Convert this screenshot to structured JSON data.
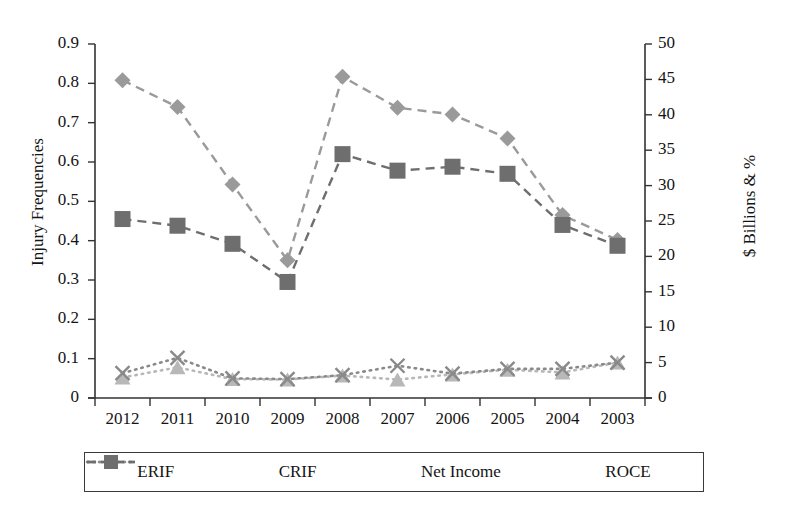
{
  "chart_data": {
    "type": "line",
    "title": "",
    "xlabel": "",
    "ylabel": "Injury Frequencies",
    "ylabel_right": "$ Billions & %",
    "categories": [
      "2012",
      "2011",
      "2010",
      "2009",
      "2008",
      "2007",
      "2006",
      "2005",
      "2004",
      "2003"
    ],
    "ylim": [
      0,
      0.9
    ],
    "ylim_right": [
      0,
      50
    ],
    "yticks": [
      "0",
      "0.1",
      "0.2",
      "0.3",
      "0.4",
      "0.5",
      "0.6",
      "0.7",
      "0.8",
      "0.9"
    ],
    "yticks_right": [
      "0",
      "5",
      "10",
      "15",
      "20",
      "25",
      "30",
      "35",
      "40",
      "45",
      "50"
    ],
    "grid": false,
    "legend_position": "bottom",
    "series": [
      {
        "name": "ERIF",
        "axis": "left",
        "marker": "triangle",
        "linestyle": "dotted",
        "color": "#b8b8b8",
        "values": [
          0.052,
          0.078,
          0.048,
          0.047,
          0.057,
          0.047,
          0.06,
          0.072,
          0.065,
          0.09
        ]
      },
      {
        "name": "CRIF",
        "axis": "left",
        "marker": "x",
        "linestyle": "dotted",
        "color": "#8a8a8a",
        "values": [
          0.063,
          0.102,
          0.05,
          0.048,
          0.058,
          0.082,
          0.062,
          0.074,
          0.074,
          0.09
        ]
      },
      {
        "name": "Net Income",
        "axis": "right",
        "marker": "diamond",
        "linestyle": "dashed",
        "color": "#9a9a9a",
        "values": [
          0.808,
          0.74,
          0.543,
          0.35,
          0.817,
          0.738,
          0.721,
          0.66,
          0.465,
          0.402
        ]
      },
      {
        "name": "ROCE",
        "axis": "right",
        "marker": "square",
        "linestyle": "dashed",
        "color": "#6e6e6e",
        "values": [
          0.455,
          0.438,
          0.392,
          0.295,
          0.62,
          0.578,
          0.588,
          0.57,
          0.44,
          0.387
        ]
      }
    ],
    "legend": [
      "ERIF",
      "CRIF",
      "Net Income",
      "ROCE"
    ]
  },
  "axes": {
    "left_title": "Injury Frequencies",
    "right_title": "$ Billions & %"
  },
  "colors": {
    "erif": "#b8b8b8",
    "crif": "#8a8a8a",
    "net_income": "#9a9a9a",
    "roce": "#6e6e6e",
    "axis": "#333333",
    "background": "#ffffff"
  }
}
